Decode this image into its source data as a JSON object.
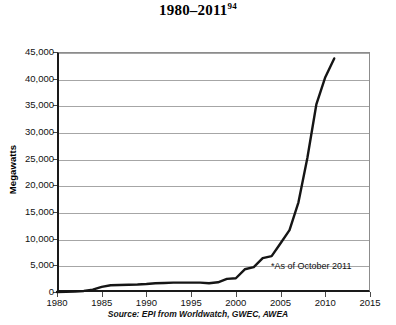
{
  "title": {
    "range_label": "1980–2011",
    "footnote_marker": "94"
  },
  "axis": {
    "ylabel": "Megawatts",
    "xlabel": "",
    "ytick_labels": [
      "0",
      "5,000",
      "10,000",
      "15,000",
      "20,000",
      "25,000",
      "30,000",
      "35,000",
      "40,000",
      "45,000"
    ],
    "xtick_labels": [
      "1980",
      "1985",
      "1990",
      "1995",
      "2000",
      "2005",
      "2010",
      "2015"
    ]
  },
  "annotations": {
    "as_of": "*As of October 2011",
    "source": "Source: EPI from Worldwatch, GWEC, AWEA",
    "credit": "Earth Policy Institute - www.earth-policy.org."
  },
  "colors": {
    "line": "#151515",
    "grid": "#a6a6a6",
    "axis": "#1a1a1a",
    "background": "#ffffff"
  },
  "chart_data": {
    "type": "line",
    "title": "1980–2011",
    "xlabel": "",
    "ylabel": "Megawatts",
    "xlim": [
      1980,
      2015
    ],
    "ylim": [
      0,
      45000
    ],
    "grid": true,
    "legend": "none",
    "x": [
      1980,
      1981,
      1982,
      1983,
      1984,
      1985,
      1986,
      1987,
      1988,
      1989,
      1990,
      1991,
      1992,
      1993,
      1994,
      1995,
      1996,
      1997,
      1998,
      1999,
      2000,
      2001,
      2002,
      2003,
      2004,
      2005,
      2006,
      2007,
      2008,
      2009,
      2010,
      2011
    ],
    "series": [
      {
        "name": "U.S. Wind Electricity Generating Capacity",
        "values": [
          10,
          30,
          90,
          200,
          430,
          950,
          1270,
          1320,
          1350,
          1400,
          1500,
          1650,
          1700,
          1750,
          1750,
          1750,
          1750,
          1650,
          1820,
          2470,
          2580,
          4260,
          4680,
          6350,
          6720,
          9150,
          11600,
          16820,
          25170,
          35160,
          40270,
          43800
        ]
      }
    ],
    "annotations": [
      "*As of October 2011"
    ],
    "source": "Source: EPI from Worldwatch, GWEC, AWEA"
  }
}
